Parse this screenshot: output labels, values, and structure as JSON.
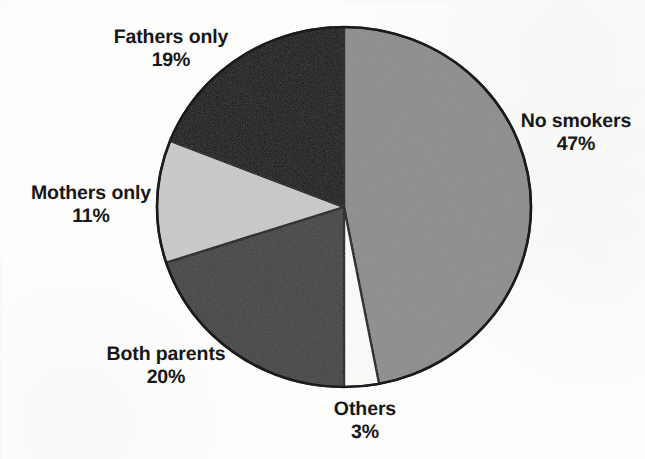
{
  "chart_data": {
    "type": "pie",
    "title": "",
    "subtitle": "",
    "xlabel": "",
    "ylabel": "",
    "legend_position": "none",
    "grid": false,
    "units": "percent",
    "start_angle_deg": 0,
    "direction": "clockwise",
    "categories": [
      "No smokers",
      "Others",
      "Both parents",
      "Mothers only",
      "Fathers only"
    ],
    "values": [
      47,
      3,
      20,
      11,
      19
    ],
    "slices": [
      {
        "label": "No smokers",
        "value": 47,
        "value_label": "47%",
        "color": "#8d8d8d",
        "start_deg": 0,
        "end_deg": 169.2,
        "label_position": "right"
      },
      {
        "label": "Others",
        "value": 3,
        "value_label": "3%",
        "color": "#fbfbf9",
        "start_deg": 169.2,
        "end_deg": 180.0,
        "label_position": "bottom"
      },
      {
        "label": "Both parents",
        "value": 20,
        "value_label": "20%",
        "color": "#434343",
        "start_deg": 180.0,
        "end_deg": 252.0,
        "label_position": "bottom-left"
      },
      {
        "label": "Mothers only",
        "value": 11,
        "value_label": "11%",
        "color": "#c9c9c9",
        "start_deg": 252.0,
        "end_deg": 291.6,
        "label_position": "left"
      },
      {
        "label": "Fathers only",
        "value": 19,
        "value_label": "19%",
        "color": "#111111",
        "start_deg": 291.6,
        "end_deg": 360.0,
        "label_position": "top-left"
      }
    ]
  },
  "labels": {
    "fathers": {
      "name": "Fathers only",
      "pct": "19%"
    },
    "no_smokers": {
      "name": "No smokers",
      "pct": "47%"
    },
    "mothers": {
      "name": "Mothers only",
      "pct": "11%"
    },
    "both_parents": {
      "name": "Both parents",
      "pct": "20%"
    },
    "others": {
      "name": "Others",
      "pct": "3%"
    }
  },
  "colors": {
    "background": "#fdfdfb",
    "outline": "#1b1b1b",
    "text": "#171717",
    "no_smokers": "#8d8d8d",
    "others": "#fbfbf9",
    "both_parents": "#434343",
    "mothers_only": "#c9c9c9",
    "fathers_only": "#111111"
  }
}
